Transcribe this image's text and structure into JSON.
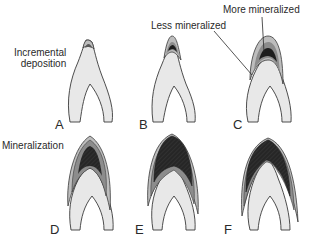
{
  "figure": {
    "annotations": {
      "incremental": [
        "Incremental",
        "deposition"
      ],
      "less_mineralized": "Less mineralized",
      "more_mineralized": "More mineralized",
      "mineralization": "Mineralization"
    },
    "panels": [
      {
        "letter": "A",
        "stage": "incremental deposition, tip only"
      },
      {
        "letter": "B",
        "stage": "deposition extending"
      },
      {
        "letter": "C",
        "stage": "layers of less and more mineralized matrix"
      },
      {
        "letter": "D",
        "stage": "mineralization begins"
      },
      {
        "letter": "E",
        "stage": "mineralization advancing"
      },
      {
        "letter": "F",
        "stage": "mineralization near complete"
      }
    ],
    "colors": {
      "dentin": "#e8e8e8",
      "outline": "#3a3a3a",
      "light_gray": "#bdbdbd",
      "mid_gray": "#8c8c8c",
      "dark": "#1e1e1e",
      "leader_line": "#2a2a2a"
    }
  }
}
